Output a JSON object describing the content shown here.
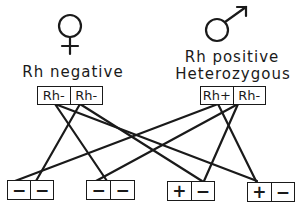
{
  "female": {
    "symbol": "♀",
    "label": "Rh negative",
    "alleles": [
      "Rh-",
      "Rh-"
    ]
  },
  "male": {
    "symbol": "♂",
    "label_line1": "Rh positive",
    "label_line2": "Heterozygous",
    "alleles": [
      "Rh+",
      "Rh-"
    ]
  },
  "offspring": [
    {
      "alleles": [
        "−",
        "−"
      ]
    },
    {
      "alleles": [
        "−",
        "−"
      ]
    },
    {
      "alleles": [
        "+",
        "−"
      ]
    },
    {
      "alleles": [
        "+",
        "−"
      ]
    }
  ],
  "colors": {
    "ink": "#1a1a1a",
    "background": "#ffffff"
  }
}
